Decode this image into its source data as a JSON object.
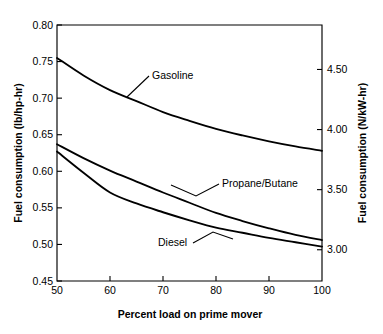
{
  "chart_data": {
    "type": "line",
    "title": "",
    "xlabel": "Percent load on prime mover",
    "ylabel": "Fuel consumption (lb/hp-hr)",
    "ylabel_secondary": "Fuel consumption (N/kW-hr)",
    "xlim": [
      50,
      100
    ],
    "ylim": [
      0.45,
      0.8
    ],
    "ylim_secondary": [
      2.74,
      4.87
    ],
    "grid": false,
    "legend": "inline-annotations",
    "xticks": [
      50,
      60,
      70,
      80,
      90,
      100
    ],
    "xticklabels": [
      "50",
      "60",
      "70",
      "80",
      "90",
      "100"
    ],
    "yticks": [
      0.45,
      0.5,
      0.55,
      0.6,
      0.65,
      0.7,
      0.75,
      0.8
    ],
    "yticklabels": [
      "0.45",
      "0.50",
      "0.55",
      "0.60",
      "0.65",
      "0.70",
      "0.75",
      "0.80"
    ],
    "yticks_secondary": [
      3.0,
      3.5,
      4.0,
      4.5
    ],
    "yticklabels_secondary": [
      "3.00",
      "3.50",
      "4.00",
      "4.50"
    ],
    "x": [
      50,
      55,
      60,
      65,
      70,
      75,
      80,
      85,
      90,
      95,
      100
    ],
    "series": [
      {
        "name": "Gasoline",
        "label": "Gasoline",
        "values": [
          0.755,
          0.731,
          0.711,
          0.696,
          0.681,
          0.669,
          0.658,
          0.649,
          0.641,
          0.634,
          0.628
        ],
        "label_x": 152,
        "label_y": 79
      },
      {
        "name": "Propane/Butane",
        "label": "Propane/Butane",
        "values": [
          0.637,
          0.618,
          0.601,
          0.586,
          0.571,
          0.557,
          0.543,
          0.532,
          0.522,
          0.513,
          0.506
        ],
        "label_x": 222,
        "label_y": 187
      },
      {
        "name": "Diesel",
        "label": "Diesel",
        "values": [
          0.627,
          0.598,
          0.571,
          0.556,
          0.544,
          0.533,
          0.523,
          0.516,
          0.509,
          0.503,
          0.497
        ],
        "label_x": 158,
        "label_y": 246
      }
    ]
  },
  "annotations": {
    "gasoline_leader": "leader-line-gasoline",
    "propane_leader": "leader-line-propane",
    "diesel_leader": "leader-line-diesel"
  },
  "colors": {
    "background": "#ffffff",
    "axis": "#000000",
    "line": "#000000",
    "text": "#000000"
  }
}
